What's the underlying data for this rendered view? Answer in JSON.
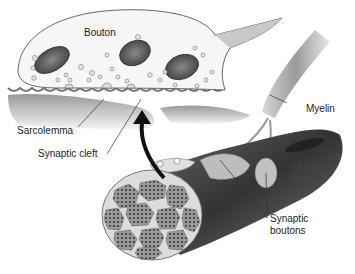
{
  "diagram": {
    "type": "anatomical-illustration",
    "labels": {
      "bouton": "Bouton",
      "myelin": "Myelin",
      "sarcolemma": "Sarcolemma",
      "synaptic_cleft": "Synaptic cleft",
      "muscle_fiber_line1": "Muscle",
      "muscle_fiber_line2": "fiber",
      "synaptic_boutons_line1": "Synaptic",
      "synaptic_boutons_line2": "boutons"
    },
    "colors": {
      "background": "#ffffff",
      "outline": "#555555",
      "mitochondria": "#5a5a5a",
      "muscle_dark": "#3a3a3a",
      "arrow": "#111111"
    }
  }
}
